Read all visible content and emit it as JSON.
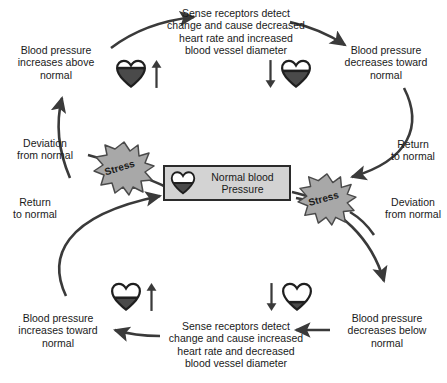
{
  "diagram": {
    "colors": {
      "stroke": "#3a3a3a",
      "text": "#1a1a1a",
      "box_fill": "#d3d3d3",
      "box_border": "#2b2b2b",
      "burst_fill": "#a8a8a8",
      "burst_stroke": "#4a4a4a",
      "heart_fill": "#4a4a4a",
      "heart_outline": "#1f1f1f"
    },
    "center": {
      "label": "Normal blood\nPressure",
      "heart_icon": "heart-half-filled-icon",
      "heart_fill_percent": 50
    },
    "nodes": [
      {
        "id": "bp-increases-above-normal",
        "label": "Blood pressure\nincreases above\nnormal",
        "heart_icon": "heart-very-full-icon",
        "heart_fill_percent": 72,
        "arrow_icon": "arrow-up-icon",
        "arrow_side": "right"
      },
      {
        "id": "bp-decreases-toward-normal",
        "label": "Blood pressure\ndecreases toward\nnormal",
        "heart_icon": "heart-full-icon",
        "heart_fill_percent": 62,
        "arrow_icon": "arrow-down-icon",
        "arrow_side": "left"
      },
      {
        "id": "bp-decreases-below-normal",
        "label": "Blood pressure\ndecreases below\nnormal",
        "heart_icon": "heart-low-icon",
        "heart_fill_percent": 28,
        "arrow_icon": "arrow-down-icon",
        "arrow_side": "left"
      },
      {
        "id": "bp-increases-toward-normal",
        "label": "Blood pressure\nincreases toward\nnormal",
        "heart_icon": "heart-half-filled-icon",
        "heart_fill_percent": 48,
        "arrow_icon": "arrow-up-icon",
        "arrow_side": "right"
      }
    ],
    "process_texts": [
      {
        "id": "upper-response",
        "text": "Sense receptors detect\nchange and cause decreased\nheart rate and increased\nblood vessel diameter"
      },
      {
        "id": "lower-response",
        "text": "Sense receptors detect\nchange and cause increased\nheart rate and decreased\nblood vessel diameter"
      }
    ],
    "path_labels": [
      {
        "id": "upper-left-deviation",
        "text": "Deviation\nfrom normal"
      },
      {
        "id": "upper-right-return",
        "text": "Return\nto normal"
      },
      {
        "id": "lower-left-return",
        "text": "Return\nto normal"
      },
      {
        "id": "lower-right-deviation",
        "text": "Deviation\nfrom normal"
      }
    ],
    "stressors": [
      {
        "id": "stress-upper-left",
        "label": "Stress",
        "icon": "starburst-icon"
      },
      {
        "id": "stress-lower-right",
        "label": "Stress",
        "icon": "starburst-icon"
      }
    ]
  }
}
